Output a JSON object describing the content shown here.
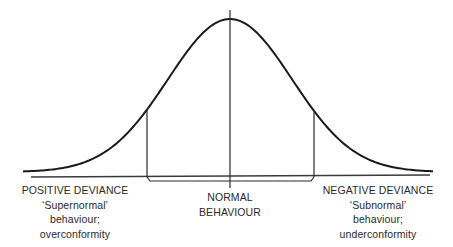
{
  "diagram": {
    "type": "normal-distribution-deviance",
    "colors": {
      "curve": "#1a1a1a",
      "lines": "#2a2a2a",
      "text": "#2a2a2a",
      "background": "#ffffff"
    },
    "labels": {
      "positive": {
        "title": "POSITIVE DEVIANCE",
        "line2": "‘Supernormal’",
        "line3": "behaviour;",
        "line4": "overconformity"
      },
      "normal": {
        "line1": "NORMAL",
        "line2": "BEHAVIOUR"
      },
      "negative": {
        "title": "NEGATIVE DEVIANCE",
        "line2": "‘Subnormal’",
        "line3": "behaviour;",
        "line4": "underconformity"
      }
    },
    "geometry": {
      "curve_center_x": 230,
      "curve_peak_y": 19,
      "curve_baseline_y": 172,
      "curve_sigma_px": 62,
      "curve_x_start": 23,
      "curve_x_end": 433,
      "mean_line": {
        "x": 230,
        "y1": 10,
        "y2": 188
      },
      "left_bound_x": 147,
      "right_bound_x": 314,
      "axis": {
        "x1": 31,
        "y1": 177,
        "x2": 430,
        "y2": 175
      },
      "bracket_y": 181
    }
  }
}
